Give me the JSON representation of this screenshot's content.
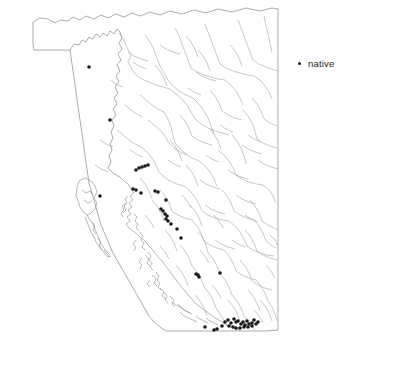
{
  "figure": {
    "kind": "distribution-map",
    "region": "British Columbia",
    "background_color": "#ffffff",
    "border_color": "#8a8a8a",
    "river_color": "#9a9a9a",
    "point_color": "#1a1a1a"
  },
  "legend": {
    "position": "top-right",
    "entries": [
      {
        "marker": "dot-icon",
        "label": "native",
        "color": "#1a1a1a"
      }
    ]
  },
  "chart_data": {
    "type": "scatter",
    "title": "",
    "xlabel": "",
    "ylabel": "",
    "legend": [
      "native"
    ],
    "series": [
      {
        "name": "native",
        "color": "#1a1a1a",
        "marker": "dot",
        "count": 52,
        "points": [
          [
            89,
            67
          ],
          [
            110,
            120
          ],
          [
            136,
            170
          ],
          [
            139,
            168
          ],
          [
            142,
            167
          ],
          [
            145,
            166
          ],
          [
            148,
            165
          ],
          [
            133,
            189
          ],
          [
            136,
            190
          ],
          [
            141,
            193
          ],
          [
            155,
            191
          ],
          [
            158,
            192
          ],
          [
            166,
            200
          ],
          [
            161,
            209
          ],
          [
            163,
            211
          ],
          [
            165,
            214
          ],
          [
            167,
            216
          ],
          [
            166,
            219
          ],
          [
            168,
            221
          ],
          [
            171,
            224
          ],
          [
            177,
            229
          ],
          [
            181,
            238
          ],
          [
            100,
            196
          ],
          [
            196,
            274
          ],
          [
            198,
            275
          ],
          [
            199,
            277
          ],
          [
            220,
            273
          ],
          [
            225,
            322
          ],
          [
            228,
            320
          ],
          [
            231,
            323
          ],
          [
            234,
            319
          ],
          [
            236,
            322
          ],
          [
            238,
            321
          ],
          [
            241,
            324
          ],
          [
            243,
            322
          ],
          [
            245,
            325
          ],
          [
            247,
            321
          ],
          [
            249,
            324
          ],
          [
            252,
            323
          ],
          [
            254,
            320
          ],
          [
            256,
            324
          ],
          [
            214,
            330
          ],
          [
            217,
            329
          ],
          [
            205,
            327
          ],
          [
            233,
            327
          ],
          [
            236,
            328
          ],
          [
            240,
            328
          ],
          [
            244,
            327
          ],
          [
            248,
            327
          ],
          [
            252,
            326
          ],
          [
            229,
            326
          ],
          [
            222,
            326
          ],
          [
            258,
            322
          ]
        ]
      }
    ],
    "axis": {
      "visible": false,
      "grid": false
    },
    "xlim": [
      0,
      416
    ],
    "ylim": [
      370,
      0
    ]
  }
}
